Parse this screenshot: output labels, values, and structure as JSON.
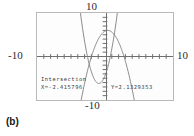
{
  "caption": "(b)",
  "axis_labels": {
    "top": "10",
    "left": "-10",
    "right": "10",
    "bottom": "-10"
  },
  "readout": {
    "title": "Intersection",
    "x_value": "X=-2.415796",
    "y_value": "Y=2.1329353"
  },
  "colors": {
    "frame": "#b9b9b9",
    "screen_bg": "#fdfdfd",
    "axis": "#6f6f6f",
    "curve": "#7a7a7a",
    "text": "#2b2b2b"
  },
  "chart_data": {
    "type": "line",
    "title": "",
    "xlabel": "",
    "ylabel": "",
    "xlim": [
      -10,
      10
    ],
    "ylim": [
      -10,
      10
    ],
    "grid": false,
    "legend": "none",
    "tick_spacing": 1,
    "annotations": [
      {
        "label": "Intersection",
        "x": -2.415796,
        "y": 2.1329353,
        "text": "X=-2.415796  Y=2.1329353"
      }
    ],
    "series": [
      {
        "name": "upward parabola",
        "type": "quadratic",
        "equation": "y = 2.2*(x + 0.9)^2 - 6.2",
        "a": 2.2,
        "h": -0.9,
        "k": -6.2,
        "x": [
          -2.8,
          -2.4,
          -2.0,
          -1.6,
          -1.2,
          -0.9,
          -0.6,
          -0.2,
          0.2,
          0.6,
          1.0,
          1.4,
          1.8,
          2.2,
          2.6
        ],
        "y": [
          1.75,
          -1.25,
          -3.54,
          -5.12,
          -6.0,
          -6.2,
          -6.0,
          -5.12,
          -3.54,
          -1.25,
          -1.0,
          6.6,
          11.6,
          14.6,
          19.9
        ]
      },
      {
        "name": "downward parabola",
        "type": "quadratic",
        "equation": "y = -1.05*(x - 0.4)^2 + 6.0",
        "a": -1.05,
        "h": 0.4,
        "k": 6.0,
        "x": [
          -3.0,
          -2.4,
          -1.8,
          -1.2,
          -0.6,
          0.0,
          0.4,
          1.0,
          1.6,
          2.2,
          2.8,
          3.4,
          4.0
        ],
        "y": [
          -6.9,
          -1.9,
          0.9,
          3.3,
          5.0,
          5.8,
          6.0,
          5.6,
          4.5,
          2.6,
          0.0,
          -3.4,
          -7.6
        ]
      }
    ],
    "intersections": [
      {
        "x": -2.415796,
        "y": 2.1329353
      },
      {
        "x": 2.6,
        "y": -1.2
      }
    ]
  }
}
